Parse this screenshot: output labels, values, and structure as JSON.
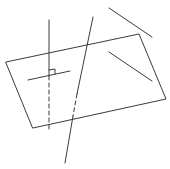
{
  "diagram": {
    "type": "geometry-3d",
    "stroke_color": "#3a3a3a",
    "background": "#ffffff",
    "plane": {
      "points": "6,62 139,34 166,99 33,128"
    },
    "perpendicular_line": {
      "solid": {
        "x1": 49,
        "y1": 20,
        "x2": 49,
        "y2": 76
      },
      "dashed": {
        "x1": 49,
        "y1": 76,
        "x2": 49,
        "y2": 130
      }
    },
    "line_in_plane": {
      "x1": 28,
      "y1": 80,
      "x2": 70,
      "y2": 71
    },
    "right_angle_mark": {
      "points": "49,70 55,69 55,74"
    },
    "oblique_line": {
      "solid_top": {
        "x1": 93,
        "y1": 17,
        "x2": 77,
        "y2": 94
      },
      "dashed_mid": {
        "x1": 77,
        "y1": 94,
        "x2": 73,
        "y2": 116
      },
      "solid_bottom": {
        "x1": 73,
        "y1": 116,
        "x2": 65,
        "y2": 163
      }
    },
    "segment_above": {
      "x1": 109,
      "y1": 8,
      "x2": 152,
      "y2": 37
    },
    "segment_in_plane": {
      "x1": 109,
      "y1": 52,
      "x2": 152,
      "y2": 81
    }
  }
}
